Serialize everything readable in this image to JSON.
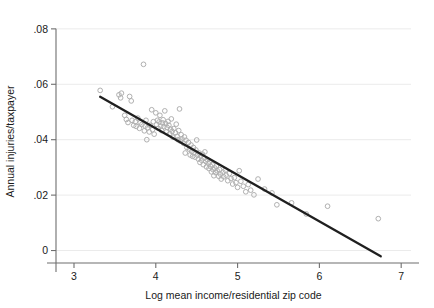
{
  "chart_data": {
    "type": "scatter",
    "title": "",
    "subtitle": "",
    "xlabel": "Log mean income/residential zip code",
    "ylabel": "Annual injuries/taxpayer",
    "xlim": [
      2.78,
      7.12
    ],
    "ylim": [
      -0.0045,
      0.0832
    ],
    "xticks": [
      3,
      4,
      5,
      6,
      7
    ],
    "xticklabels": [
      "3",
      "4",
      "5",
      "6",
      "7"
    ],
    "yticks": [
      0,
      0.02,
      0.04,
      0.06,
      0.08
    ],
    "yticklabels": [
      "0",
      ".02",
      ".04",
      ".06",
      ".08"
    ],
    "grid": "horizontal",
    "legend": "none",
    "marker_style": "open-circle",
    "marker_color": "#b0b0b0",
    "fit_line_color": "#1f1f1f",
    "series": [
      {
        "name": "Zip code observations",
        "type": "scatter",
        "points": [
          [
            3.32,
            0.0578
          ],
          [
            3.47,
            0.0519
          ],
          [
            3.55,
            0.0562
          ],
          [
            3.57,
            0.0551
          ],
          [
            3.58,
            0.0568
          ],
          [
            3.62,
            0.0488
          ],
          [
            3.64,
            0.0473
          ],
          [
            3.66,
            0.0462
          ],
          [
            3.68,
            0.0556
          ],
          [
            3.7,
            0.054
          ],
          [
            3.71,
            0.047
          ],
          [
            3.73,
            0.0452
          ],
          [
            3.75,
            0.0465
          ],
          [
            3.76,
            0.0448
          ],
          [
            3.78,
            0.0478
          ],
          [
            3.8,
            0.0441
          ],
          [
            3.81,
            0.0461
          ],
          [
            3.83,
            0.0455
          ],
          [
            3.85,
            0.0672
          ],
          [
            3.86,
            0.0432
          ],
          [
            3.87,
            0.0449
          ],
          [
            3.88,
            0.047
          ],
          [
            3.89,
            0.04
          ],
          [
            3.9,
            0.0443
          ],
          [
            3.92,
            0.0428
          ],
          [
            3.93,
            0.0452
          ],
          [
            3.95,
            0.0508
          ],
          [
            3.96,
            0.0436
          ],
          [
            3.97,
            0.0465
          ],
          [
            3.98,
            0.042
          ],
          [
            4.0,
            0.0497
          ],
          [
            4.01,
            0.0455
          ],
          [
            4.02,
            0.047
          ],
          [
            4.03,
            0.0441
          ],
          [
            4.04,
            0.0464
          ],
          [
            4.05,
            0.0488
          ],
          [
            4.06,
            0.0449
          ],
          [
            4.07,
            0.0433
          ],
          [
            4.08,
            0.0461
          ],
          [
            4.09,
            0.0472
          ],
          [
            4.1,
            0.0447
          ],
          [
            4.11,
            0.0504
          ],
          [
            4.12,
            0.0458
          ],
          [
            4.13,
            0.0428
          ],
          [
            4.14,
            0.0444
          ],
          [
            4.15,
            0.0466
          ],
          [
            4.16,
            0.0452
          ],
          [
            4.17,
            0.0421
          ],
          [
            4.18,
            0.0438
          ],
          [
            4.19,
            0.0475
          ],
          [
            4.2,
            0.043
          ],
          [
            4.21,
            0.0409
          ],
          [
            4.22,
            0.044
          ],
          [
            4.24,
            0.0425
          ],
          [
            4.25,
            0.0456
          ],
          [
            4.26,
            0.0412
          ],
          [
            4.27,
            0.04
          ],
          [
            4.28,
            0.0433
          ],
          [
            4.29,
            0.0511
          ],
          [
            4.3,
            0.0395
          ],
          [
            4.31,
            0.0418
          ],
          [
            4.32,
            0.0403
          ],
          [
            4.34,
            0.0387
          ],
          [
            4.35,
            0.041
          ],
          [
            4.36,
            0.0352
          ],
          [
            4.37,
            0.0398
          ],
          [
            4.38,
            0.0372
          ],
          [
            4.4,
            0.039
          ],
          [
            4.41,
            0.0366
          ],
          [
            4.42,
            0.0345
          ],
          [
            4.43,
            0.0381
          ],
          [
            4.44,
            0.0358
          ],
          [
            4.45,
            0.034
          ],
          [
            4.46,
            0.0372
          ],
          [
            4.47,
            0.0355
          ],
          [
            4.48,
            0.0337
          ],
          [
            4.49,
            0.0363
          ],
          [
            4.5,
            0.0399
          ],
          [
            4.51,
            0.0344
          ],
          [
            4.52,
            0.033
          ],
          [
            4.53,
            0.0352
          ],
          [
            4.54,
            0.0318
          ],
          [
            4.55,
            0.0341
          ],
          [
            4.56,
            0.0326
          ],
          [
            4.57,
            0.0348
          ],
          [
            4.58,
            0.031
          ],
          [
            4.59,
            0.0333
          ],
          [
            4.6,
            0.0356
          ],
          [
            4.61,
            0.0322
          ],
          [
            4.62,
            0.0302
          ],
          [
            4.63,
            0.0328
          ],
          [
            4.64,
            0.0315
          ],
          [
            4.65,
            0.0296
          ],
          [
            4.66,
            0.0319
          ],
          [
            4.67,
            0.0304
          ],
          [
            4.68,
            0.0284
          ],
          [
            4.69,
            0.031
          ],
          [
            4.7,
            0.0292
          ],
          [
            4.71,
            0.027
          ],
          [
            4.72,
            0.0298
          ],
          [
            4.73,
            0.0281
          ],
          [
            4.74,
            0.0305
          ],
          [
            4.75,
            0.0288
          ],
          [
            4.77,
            0.0268
          ],
          [
            4.78,
            0.0292
          ],
          [
            4.79,
            0.0276
          ],
          [
            4.8,
            0.0258
          ],
          [
            4.82,
            0.0283
          ],
          [
            4.83,
            0.0266
          ],
          [
            4.85,
            0.029
          ],
          [
            4.86,
            0.0272
          ],
          [
            4.88,
            0.0252
          ],
          [
            4.9,
            0.0278
          ],
          [
            4.92,
            0.026
          ],
          [
            4.94,
            0.024
          ],
          [
            4.96,
            0.0263
          ],
          [
            4.98,
            0.0245
          ],
          [
            5.0,
            0.0228
          ],
          [
            5.02,
            0.0288
          ],
          [
            5.04,
            0.025
          ],
          [
            5.07,
            0.0232
          ],
          [
            5.1,
            0.0212
          ],
          [
            5.13,
            0.0238
          ],
          [
            5.16,
            0.0218
          ],
          [
            5.2,
            0.0201
          ],
          [
            5.25,
            0.0258
          ],
          [
            5.33,
            0.0222
          ],
          [
            5.42,
            0.0208
          ],
          [
            5.48,
            0.0165
          ],
          [
            5.66,
            0.0172
          ],
          [
            5.84,
            0.0132
          ],
          [
            6.1,
            0.016
          ],
          [
            6.72,
            0.0115
          ]
        ]
      }
    ],
    "fit_line": {
      "name": "Linear fit",
      "type": "line",
      "x_start": 3.32,
      "y_start": 0.0555,
      "x_end": 6.75,
      "y_end": -0.0021
    }
  }
}
